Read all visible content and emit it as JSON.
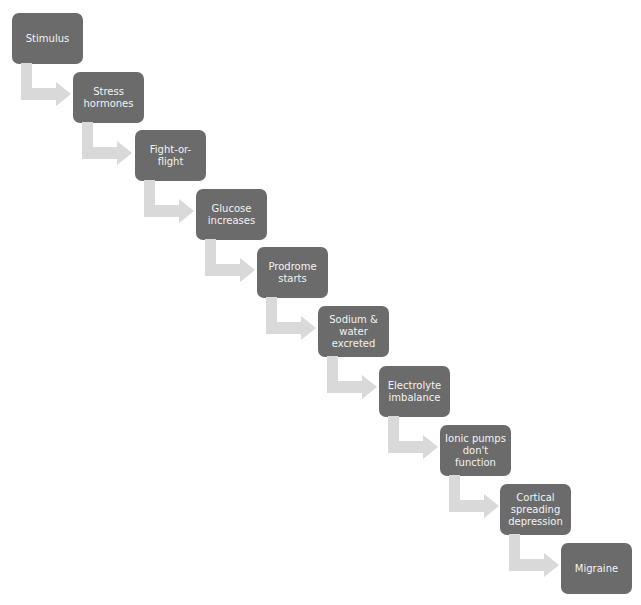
{
  "diagram": {
    "type": "staircase-process-flow",
    "colors": {
      "box_fill": "#6b6b6b",
      "box_text": "#f2f2f2",
      "arrow_fill": "#d9d9d9",
      "background": "#ffffff"
    },
    "steps": [
      {
        "label": "Stimulus"
      },
      {
        "label": "Stress\nhormones"
      },
      {
        "label": "Fight-or-\nflight"
      },
      {
        "label": "Glucose\nincreases"
      },
      {
        "label": "Prodrome\nstarts"
      },
      {
        "label": "Sodium &\nwater\nexcreted"
      },
      {
        "label": "Electrolyte\nimbalance"
      },
      {
        "label": "Ionic pumps\ndon't\nfunction"
      },
      {
        "label": "Cortical\nspreading\ndepression"
      },
      {
        "label": "Migraine"
      }
    ],
    "connectors": [
      {
        "from": 0,
        "to": 1,
        "icon": "elbow-arrow-icon"
      },
      {
        "from": 1,
        "to": 2,
        "icon": "elbow-arrow-icon"
      },
      {
        "from": 2,
        "to": 3,
        "icon": "elbow-arrow-icon"
      },
      {
        "from": 3,
        "to": 4,
        "icon": "elbow-arrow-icon"
      },
      {
        "from": 4,
        "to": 5,
        "icon": "elbow-arrow-icon"
      },
      {
        "from": 5,
        "to": 6,
        "icon": "elbow-arrow-icon"
      },
      {
        "from": 6,
        "to": 7,
        "icon": "elbow-arrow-icon"
      },
      {
        "from": 7,
        "to": 8,
        "icon": "elbow-arrow-icon"
      },
      {
        "from": 8,
        "to": 9,
        "icon": "elbow-arrow-icon"
      }
    ]
  }
}
